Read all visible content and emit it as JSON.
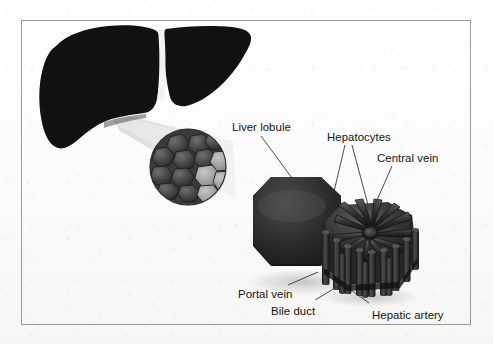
{
  "figure": {
    "width": 493,
    "height": 344,
    "background_color": "#fdfdfd",
    "border_color": "#9a9a9a"
  },
  "labels": [
    {
      "id": "liver-lobule",
      "text": "Liver lobule",
      "x": 232,
      "y": 121
    },
    {
      "id": "hepatocytes",
      "text": "Hepatocytes",
      "x": 327,
      "y": 131
    },
    {
      "id": "central-vein",
      "text": "Central vein",
      "x": 377,
      "y": 152
    },
    {
      "id": "portal-vein",
      "text": "Portal vein",
      "x": 238,
      "y": 288
    },
    {
      "id": "bile-duct",
      "text": "Bile duct",
      "x": 271,
      "y": 305
    },
    {
      "id": "hepatic-artery",
      "text": "Hepatic artery",
      "x": 372,
      "y": 309
    }
  ],
  "leader_lines": [
    {
      "id": "leader-liver-lobule",
      "x1": 261,
      "y1": 136,
      "x2": 292,
      "y2": 178
    },
    {
      "id": "leader-hepatocytes-a",
      "x1": 345,
      "y1": 145,
      "x2": 332,
      "y2": 200
    },
    {
      "id": "leader-hepatocytes-b",
      "x1": 352,
      "y1": 145,
      "x2": 368,
      "y2": 205
    },
    {
      "id": "leader-central-vein",
      "x1": 392,
      "y1": 166,
      "x2": 374,
      "y2": 207
    },
    {
      "id": "leader-portal-vein",
      "x1": 288,
      "y1": 285,
      "x2": 318,
      "y2": 272
    },
    {
      "id": "leader-bile-duct",
      "x1": 315,
      "y1": 300,
      "x2": 337,
      "y2": 287
    },
    {
      "id": "leader-hepatic-artery",
      "x1": 369,
      "y1": 303,
      "x2": 351,
      "y2": 290
    }
  ],
  "structures": {
    "liver_silhouette": {
      "name": "liver organ silhouette",
      "fill": "#111111",
      "falciform_ligament_color": "#f2f2f2"
    },
    "magnification_beam": {
      "name": "magnification light cone",
      "fill": "#e6e6e6"
    },
    "cell_cluster": {
      "name": "hepatocyte cell cluster",
      "cell_count": 14,
      "fill_dark": "#4a4a4a",
      "fill_light": "#9a9a9a"
    },
    "lobule_block": {
      "name": "liver lobule hexagonal prism",
      "fill": "#2b2b2b"
    },
    "lobule_detail": {
      "name": "detailed hepatic lobule",
      "radiating_plates": 12,
      "vessel_columns": 12,
      "fill": "#3a3a3a"
    }
  }
}
